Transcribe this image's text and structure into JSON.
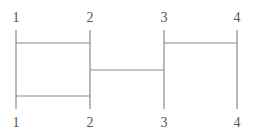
{
  "diagram": {
    "type": "ladder-network",
    "lines": [
      {
        "id": 1,
        "top_label": "1",
        "bottom_label": "2"
      },
      {
        "id": 2,
        "top_label": "2",
        "bottom_label": "2"
      },
      {
        "id": 3,
        "top_label": "3",
        "bottom_label": "3"
      },
      {
        "id": 4,
        "top_label": "4",
        "bottom_label": "4"
      }
    ],
    "labels": {
      "top": [
        "1",
        "2",
        "3",
        "4"
      ],
      "bottom": [
        "1",
        "2",
        "3",
        "4"
      ]
    },
    "rungs": [
      {
        "from": 1,
        "to": 2,
        "level": "top"
      },
      {
        "from": 3,
        "to": 4,
        "level": "top"
      },
      {
        "from": 2,
        "to": 3,
        "level": "middle"
      },
      {
        "from": 1,
        "to": 2,
        "level": "bottom"
      }
    ],
    "colors": {
      "line": "#8a8a8a",
      "text": "#555555",
      "background": "#ffffff"
    }
  }
}
